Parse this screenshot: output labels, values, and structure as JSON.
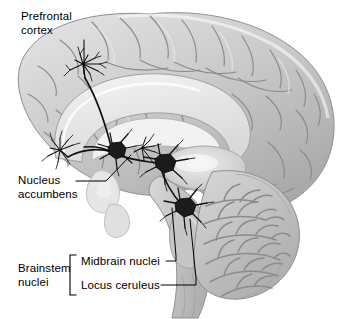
{
  "figure": {
    "background_color": "#ffffff",
    "ink_color": "#000000"
  },
  "labels": {
    "prefrontal_cortex": "Prefrontal\ncortex",
    "nucleus_accumbens": "Nucleus\naccumbens",
    "brainstem_nuclei": "Brainstem\nnuclei",
    "midbrain_nuclei": "Midbrain nuclei",
    "locus_ceruleus": "Locus ceruleus"
  },
  "anatomy": {
    "regions": [
      "cerebral-cortex",
      "corpus-callosum",
      "thalamus",
      "cerebellum",
      "brainstem",
      "lateral-ventricle",
      "nucleus-accumbens-body"
    ],
    "palette": {
      "cortex_light": "#d8d8d8",
      "cortex_mid": "#bdbdbd",
      "cortex_dark": "#9a9a9a",
      "sulcus_line": "#8a8a8a",
      "white_matter": "#ececec",
      "cerebellum_base": "#c4c4c4",
      "cerebellum_branch": "#8f8f8f",
      "brainstem": "#c9c9c9",
      "ventricle": "#f2f2f2"
    }
  },
  "neurons": [
    {
      "name": "midbrain-nucleus-neuron",
      "type": "soma-with-dendrites"
    },
    {
      "name": "locus-ceruleus-neuron",
      "type": "soma-with-dendrites"
    },
    {
      "name": "nucleus-accumbens-neuron",
      "type": "soma-with-dendrites"
    }
  ],
  "terminals": [
    {
      "name": "prefrontal-cortex-terminal-arbor",
      "type": "axon-terminal-arborization"
    },
    {
      "name": "frontal-cortex-terminal-arbor",
      "type": "axon-terminal-arborization"
    },
    {
      "name": "accumbens-terminal-arbor",
      "type": "axon-terminal-arborization"
    }
  ],
  "leader_lines": [
    {
      "name": "leader-prefrontal-cortex",
      "points_to": "prefrontal-cortex-terminal-arbor"
    },
    {
      "name": "leader-nucleus-accumbens",
      "points_to": "nucleus-accumbens-neuron"
    },
    {
      "name": "leader-midbrain-nuclei",
      "points_to": "midbrain-nucleus-neuron"
    },
    {
      "name": "leader-locus-ceruleus",
      "points_to": "locus-ceruleus-neuron"
    }
  ],
  "bracket": {
    "name": "brainstem-nuclei-bracket",
    "groups": [
      "midbrain_nuclei",
      "locus_ceruleus"
    ]
  }
}
